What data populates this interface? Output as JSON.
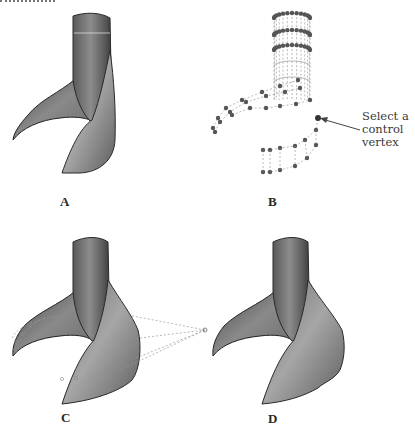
{
  "figure": {
    "panels": [
      {
        "id": "A",
        "label": "A",
        "description": "Smooth shaded NURBS surface"
      },
      {
        "id": "B",
        "label": "B",
        "description": "Control-vertex hull wireframe"
      },
      {
        "id": "C",
        "label": "C",
        "description": "Shaded surface with a control vertex pulled outward"
      },
      {
        "id": "D",
        "label": "D",
        "description": "Resulting deformed surface"
      }
    ],
    "callout": {
      "line1": "Select a",
      "line2": "control",
      "line3": "vertex"
    },
    "colors": {
      "surface_dark": "#3e3e3e",
      "surface_mid": "#7a7a7a",
      "surface_light": "#b4b4b4",
      "cv_point": "#555555",
      "hull_line": "#8a8a8a",
      "background": "#ffffff"
    }
  }
}
